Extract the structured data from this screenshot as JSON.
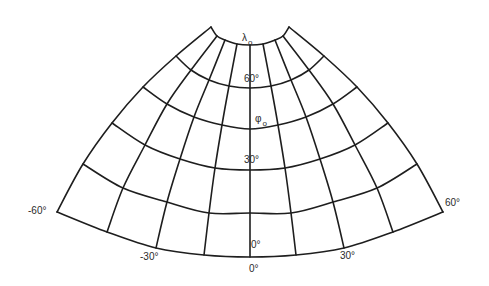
{
  "figure": {
    "type": "conic map projection graticule",
    "central_meridian_label": "λ",
    "central_meridian_subscript": "o",
    "standard_parallel_label": "φ",
    "standard_parallel_subscript": "o"
  },
  "colors": {
    "line": "#1e1e1e",
    "text": "#2a2a2a",
    "background": "#ffffff"
  },
  "parallels_deg": [
    0,
    15,
    30,
    45,
    60,
    75
  ],
  "meridians_deg": [
    -60,
    -45,
    -30,
    -15,
    0,
    15,
    30,
    45,
    60
  ],
  "left_meridian_points": {
    "-60": [
      [
        57,
        212
      ],
      [
        83,
        164
      ],
      [
        112,
        123
      ],
      [
        143,
        87
      ],
      [
        176,
        56
      ],
      [
        211,
        27
      ]
    ],
    "-45": [
      [
        107,
        232
      ],
      [
        123,
        188
      ],
      [
        145,
        145
      ],
      [
        167,
        104
      ],
      [
        191,
        70
      ],
      [
        217,
        36
      ]
    ],
    "-30": [
      [
        156,
        248
      ],
      [
        167,
        202
      ],
      [
        180,
        159
      ],
      [
        194,
        117
      ],
      [
        209,
        80
      ],
      [
        225,
        40
      ]
    ],
    "-15": [
      [
        204,
        255
      ],
      [
        209,
        213
      ],
      [
        215,
        168
      ],
      [
        222,
        125
      ],
      [
        229,
        86
      ],
      [
        237,
        44
      ]
    ],
    "0": [
      [
        250,
        257
      ],
      [
        250,
        213
      ],
      [
        250,
        170
      ],
      [
        250,
        129
      ],
      [
        250,
        88
      ],
      [
        250,
        45
      ]
    ]
  },
  "labels": [
    {
      "id": "lambda0",
      "text": "λ",
      "sub": "o",
      "x": 242,
      "y": 41
    },
    {
      "id": "lat-60",
      "text": "60°",
      "x": 244,
      "y": 82
    },
    {
      "id": "phi0",
      "text": "φ",
      "sub": "o",
      "x": 255,
      "y": 122
    },
    {
      "id": "lat-30",
      "text": "30°",
      "x": 244,
      "y": 163
    },
    {
      "id": "lat-0",
      "text": "0°",
      "x": 251,
      "y": 248
    },
    {
      "id": "lon-0",
      "text": "0°",
      "x": 249,
      "y": 272
    },
    {
      "id": "lon-m30",
      "text": "-30°",
      "x": 140,
      "y": 260
    },
    {
      "id": "lon-30",
      "text": "30°",
      "x": 340,
      "y": 259
    },
    {
      "id": "lon-m60",
      "text": "-60°",
      "x": 28,
      "y": 214
    },
    {
      "id": "lon-60",
      "text": "60°",
      "x": 445,
      "y": 206
    }
  ]
}
